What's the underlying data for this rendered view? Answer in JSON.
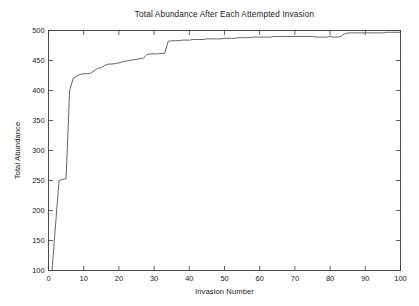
{
  "figure": {
    "background_color": "#ffffff",
    "line_color": "#4a4a4a",
    "axis_color": "#3a3a3a"
  },
  "chart_data": {
    "type": "line",
    "title": "Total Abundance After Each Attempted Invasion",
    "xlabel": "Invasion Number",
    "ylabel": "Total Abundance",
    "xlim": [
      0,
      100
    ],
    "ylim": [
      100,
      500
    ],
    "xticks": [
      0,
      10,
      20,
      30,
      40,
      50,
      60,
      70,
      80,
      90,
      100
    ],
    "yticks": [
      100,
      150,
      200,
      250,
      300,
      350,
      400,
      450,
      500
    ],
    "xticklabels": [
      "0",
      "10",
      "20",
      "30",
      "40",
      "50",
      "60",
      "70",
      "80",
      "90",
      "100"
    ],
    "yticklabels": [
      "100",
      "150",
      "200",
      "250",
      "300",
      "350",
      "400",
      "450",
      "500"
    ],
    "grid": false,
    "legend": null,
    "series": [
      {
        "name": "Total Abundance",
        "x": [
          0,
          1,
          2,
          3,
          4,
          5,
          6,
          7,
          8,
          9,
          10,
          11,
          12,
          13,
          14,
          15,
          16,
          17,
          18,
          19,
          20,
          21,
          22,
          23,
          24,
          25,
          26,
          27,
          28,
          29,
          30,
          31,
          32,
          33,
          34,
          35,
          36,
          37,
          38,
          39,
          40,
          41,
          42,
          43,
          44,
          45,
          46,
          47,
          48,
          49,
          50,
          51,
          52,
          53,
          54,
          55,
          56,
          57,
          58,
          59,
          60,
          61,
          62,
          63,
          64,
          65,
          66,
          67,
          68,
          69,
          70,
          71,
          72,
          73,
          74,
          75,
          76,
          77,
          78,
          79,
          80,
          81,
          82,
          83,
          84,
          85,
          86,
          87,
          88,
          89,
          90,
          91,
          92,
          93,
          94,
          95,
          96,
          97,
          98,
          99,
          100
        ],
        "y": [
          100,
          100,
          176,
          250,
          252,
          253,
          400,
          420,
          424,
          427,
          428,
          428,
          429,
          433,
          437,
          438,
          442,
          444,
          444,
          445,
          446,
          448,
          449,
          450,
          451,
          452,
          453,
          454,
          460,
          461,
          461,
          461,
          462,
          462,
          482,
          483,
          483,
          483,
          484,
          484,
          484,
          485,
          485,
          485,
          485,
          486,
          486,
          486,
          486,
          486,
          487,
          487,
          487,
          487,
          488,
          488,
          488,
          488,
          489,
          489,
          489,
          489,
          489,
          489,
          490,
          490,
          490,
          490,
          490,
          490,
          490,
          490,
          490,
          490,
          490,
          490,
          489,
          489,
          489,
          489,
          490,
          489,
          489,
          490,
          494,
          496,
          496,
          496,
          496,
          496,
          496,
          496,
          496,
          496,
          496,
          496,
          497,
          497,
          497,
          497,
          497
        ]
      }
    ]
  }
}
